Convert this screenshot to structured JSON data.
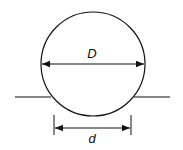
{
  "diagram": {
    "type": "sphere-contact-dimension",
    "labels": {
      "diameter": "D",
      "contact_width": "d"
    },
    "colors": {
      "stroke": "#111111",
      "background": "#ffffff"
    },
    "geometry": {
      "circle": {
        "cx": 93,
        "cy": 64,
        "r": 52
      },
      "baseline_y": 97,
      "baseline_left": [
        15,
        51
      ],
      "baseline_right": [
        134,
        170
      ],
      "D_arrow": {
        "x1": 41,
        "x2": 145,
        "y": 64
      },
      "d_arrow": {
        "x1": 54,
        "x2": 131,
        "y": 129
      },
      "d_ticks": {
        "y1": 115,
        "y2": 134
      }
    }
  }
}
